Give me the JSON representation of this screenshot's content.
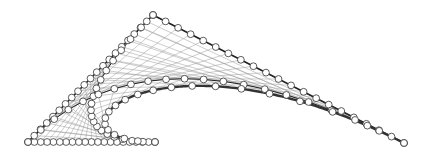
{
  "diagram": {
    "type": "bezier-construction",
    "control_points": [
      {
        "name": "P0",
        "x": 155,
        "y": 142
      },
      {
        "name": "P1",
        "x": 28,
        "y": 142
      },
      {
        "name": "P2",
        "x": 153,
        "y": 15
      },
      {
        "name": "P3",
        "x": 404,
        "y": 143
      }
    ],
    "subdivisions": 20,
    "colors": {
      "background": "#ffffff",
      "control_polygon": "#222222",
      "construction_lines": "#9a9a9a",
      "curve": "#333333",
      "point_fill": "#ffffff",
      "point_stroke": "#333333"
    },
    "point_radius": 3.4
  }
}
